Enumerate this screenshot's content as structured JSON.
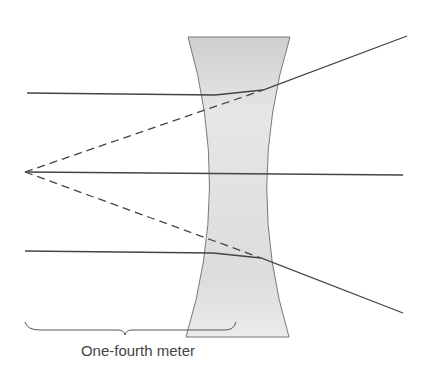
{
  "diagram": {
    "caption": "One-fourth meter",
    "colors": {
      "ray": "#444444",
      "lens_fill": "#d9d9d9",
      "lens_edge": "#777777",
      "background": "#ffffff"
    },
    "elements": {
      "lens": "concave (diverging) lens",
      "incident_rays": 3,
      "virtual_rays": 2,
      "focal_point": "virtual focus on left",
      "brace": "distance indicator from focal point to lens"
    }
  }
}
